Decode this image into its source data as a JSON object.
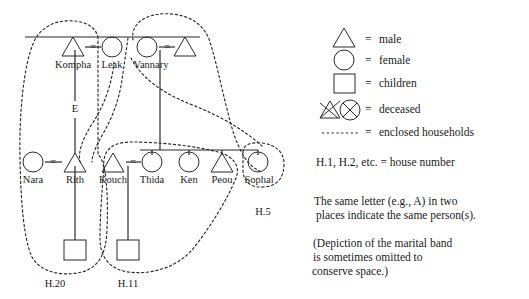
{
  "figure": {
    "type": "kinship-genealogy-diagram",
    "title": "",
    "background_color": "#ffffff",
    "stroke_color": "#2a2a2a"
  },
  "persons": [
    {
      "id": "kompha",
      "name": "Kompha",
      "symbol": "triangle",
      "sex": "male",
      "generation": 1,
      "x": 73,
      "y": 47
    },
    {
      "id": "leak",
      "name": "Leak",
      "symbol": "circle",
      "sex": "female",
      "generation": 1,
      "x": 112,
      "y": 47
    },
    {
      "id": "vannary",
      "name": "Vannary",
      "symbol": "circle",
      "sex": "female",
      "generation": 1,
      "x": 147,
      "y": 47
    },
    {
      "id": "spouse1",
      "name": "",
      "symbol": "triangle",
      "sex": "male",
      "generation": 1,
      "x": 185,
      "y": 47
    },
    {
      "id": "nara",
      "name": "Nara",
      "symbol": "circle",
      "sex": "female",
      "generation": 2,
      "x": 33,
      "y": 162
    },
    {
      "id": "rith",
      "name": "Rith",
      "symbol": "triangle",
      "sex": "male",
      "generation": 2,
      "x": 75,
      "y": 162
    },
    {
      "id": "kouch",
      "name": "Kouch",
      "symbol": "triangle",
      "sex": "male",
      "generation": 2,
      "x": 113,
      "y": 162
    },
    {
      "id": "thida",
      "name": "Thida",
      "symbol": "circle",
      "sex": "female",
      "generation": 2,
      "x": 152,
      "y": 162
    },
    {
      "id": "ken",
      "name": "Ken",
      "symbol": "circle",
      "sex": "female",
      "generation": 2,
      "x": 189,
      "y": 162
    },
    {
      "id": "peou",
      "name": "Peou",
      "symbol": "triangle",
      "sex": "male",
      "generation": 2,
      "x": 222,
      "y": 162
    },
    {
      "id": "sophal",
      "name": "Sophal",
      "symbol": "circle",
      "sex": "female",
      "generation": 2,
      "x": 258,
      "y": 162
    },
    {
      "id": "child_h20",
      "name": "",
      "symbol": "square",
      "sex": "children",
      "generation": 3,
      "x": 75,
      "y": 249
    },
    {
      "id": "child_h11",
      "name": "",
      "symbol": "square",
      "sex": "children",
      "generation": 3,
      "x": 128,
      "y": 249
    }
  ],
  "marriages": [
    {
      "id": "kompha-leak",
      "left": "kompha",
      "right": "leak",
      "mark": "="
    },
    {
      "id": "vannary-sp1",
      "left": "vannary",
      "right": "spouse1",
      "mark": "="
    },
    {
      "id": "nara-rith",
      "left": "nara",
      "right": "rith",
      "mark": "="
    },
    {
      "id": "kouch-thida",
      "left": "kouch",
      "right": "thida",
      "mark": "="
    }
  ],
  "link_letters": [
    {
      "id": "letterE",
      "label": "E",
      "x": 75,
      "y": 110
    }
  ],
  "households": [
    {
      "id": "h20",
      "label": "H.20",
      "label_x": 55,
      "label_y": 285,
      "members": [
        "nara",
        "rith",
        "child_h20"
      ]
    },
    {
      "id": "h11",
      "label": "H.11",
      "label_x": 128,
      "label_y": 285,
      "members": [
        "kouch",
        "thida",
        "child_h11"
      ]
    },
    {
      "id": "h5",
      "label": "H.5",
      "label_x": 263,
      "label_y": 213,
      "members": [
        "sophal"
      ]
    }
  ],
  "legend": {
    "items": [
      {
        "id": "male",
        "icon": "triangle-icon",
        "equals": "=",
        "label": "male"
      },
      {
        "id": "female",
        "icon": "circle-icon",
        "equals": "=",
        "label": "female"
      },
      {
        "id": "children",
        "icon": "square-icon",
        "equals": "=",
        "label": "children"
      },
      {
        "id": "deceased",
        "icon": "crossed-shapes-icon",
        "equals": "=",
        "label": "deceased"
      },
      {
        "id": "household",
        "icon": "dashed-line-icon",
        "equals": "=",
        "label": "enclosed households"
      }
    ],
    "house_number_note": "H.1, H.2, etc. = house number"
  },
  "notes": {
    "same_letter": "The same letter (e.g., A) in two places indicate the same person(s).",
    "same_letter_line1": "The same letter (e.g., A) in two",
    "same_letter_line2": "places indicate the same person(s).",
    "marital_band_line1": "(Depiction of the marital band",
    "marital_band_line2": "is sometimes omitted to",
    "marital_band_line3": "conserve space.)"
  }
}
